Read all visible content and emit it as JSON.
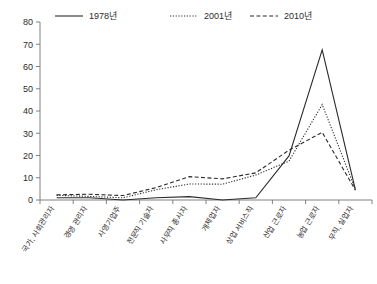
{
  "chart_data": {
    "type": "line",
    "title": "",
    "xlabel": "",
    "ylabel": "",
    "ylim": [
      0,
      80
    ],
    "yticks": [
      0,
      10,
      20,
      30,
      40,
      50,
      60,
      70,
      80
    ],
    "grid": false,
    "legend_position": "top",
    "categories": [
      "국가, 사회관리자",
      "경영 관리자",
      "사영기업주",
      "전문직 기술자",
      "사무직 종사자",
      "개체업자",
      "상업 서비스직",
      "산업 근로자",
      "농업 근로자",
      "무직, 실업자"
    ],
    "series": [
      {
        "name": "1978년",
        "style": "solid",
        "values": [
          1.0,
          1.0,
          0.0,
          1.0,
          1.5,
          0.0,
          1.0,
          19.8,
          67.5,
          4.5
        ]
      },
      {
        "name": "2001년",
        "style": "dotted",
        "values": [
          2.1,
          1.6,
          1.0,
          4.6,
          7.2,
          7.1,
          11.2,
          17.5,
          42.9,
          4.8
        ]
      },
      {
        "name": "2010년",
        "style": "dashed",
        "values": [
          2.3,
          2.6,
          2.0,
          5.6,
          10.5,
          9.5,
          12.2,
          22.4,
          30.4,
          4.4
        ]
      }
    ]
  },
  "legend": {
    "entries": [
      {
        "label": "1978년"
      },
      {
        "label": "2001년"
      },
      {
        "label": "2010년"
      }
    ]
  }
}
